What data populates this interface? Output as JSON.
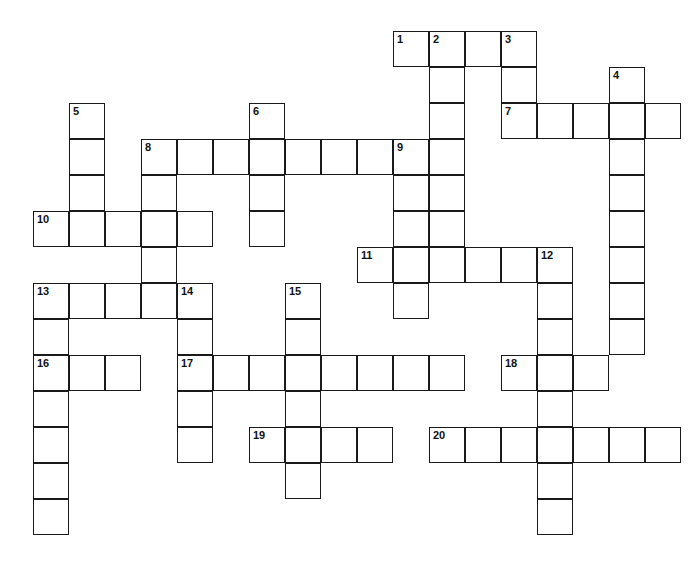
{
  "puzzle": {
    "title": "Crossword Puzzle Grid",
    "background_color": "#ffffff",
    "cell_fill_color": "#ffffff",
    "cell_border_color": "#1a1a1a",
    "number_color": "#111111",
    "cell_size_px": 36,
    "grid_origin_x": 33,
    "grid_origin_y": 31,
    "columns": 18,
    "rows": 14,
    "total_cells": 114,
    "numbered_clue_count": 20
  },
  "numbers": [
    {
      "label": "1",
      "col": 10,
      "row": 0
    },
    {
      "label": "2",
      "col": 11,
      "row": 0
    },
    {
      "label": "3",
      "col": 13,
      "row": 0
    },
    {
      "label": "4",
      "col": 16,
      "row": 1
    },
    {
      "label": "5",
      "col": 1,
      "row": 2
    },
    {
      "label": "6",
      "col": 6,
      "row": 2
    },
    {
      "label": "7",
      "col": 13,
      "row": 2
    },
    {
      "label": "8",
      "col": 3,
      "row": 3
    },
    {
      "label": "9",
      "col": 10,
      "row": 3
    },
    {
      "label": "10",
      "col": 0,
      "row": 5
    },
    {
      "label": "11",
      "col": 9,
      "row": 6
    },
    {
      "label": "12",
      "col": 14,
      "row": 6
    },
    {
      "label": "13",
      "col": 0,
      "row": 7
    },
    {
      "label": "14",
      "col": 4,
      "row": 7
    },
    {
      "label": "15",
      "col": 7,
      "row": 7
    },
    {
      "label": "16",
      "col": 0,
      "row": 9
    },
    {
      "label": "17",
      "col": 4,
      "row": 9
    },
    {
      "label": "18",
      "col": 13,
      "row": 9
    },
    {
      "label": "19",
      "col": 6,
      "row": 11
    },
    {
      "label": "20",
      "col": 11,
      "row": 11
    }
  ],
  "cells": [
    {
      "col": 10,
      "row": 0
    },
    {
      "col": 11,
      "row": 0
    },
    {
      "col": 12,
      "row": 0
    },
    {
      "col": 13,
      "row": 0
    },
    {
      "col": 11,
      "row": 1
    },
    {
      "col": 13,
      "row": 1
    },
    {
      "col": 16,
      "row": 1
    },
    {
      "col": 11,
      "row": 2
    },
    {
      "col": 13,
      "row": 2
    },
    {
      "col": 14,
      "row": 2
    },
    {
      "col": 15,
      "row": 2
    },
    {
      "col": 16,
      "row": 2
    },
    {
      "col": 17,
      "row": 2
    },
    {
      "col": 1,
      "row": 2
    },
    {
      "col": 6,
      "row": 2
    },
    {
      "col": 1,
      "row": 3
    },
    {
      "col": 3,
      "row": 3
    },
    {
      "col": 4,
      "row": 3
    },
    {
      "col": 5,
      "row": 3
    },
    {
      "col": 6,
      "row": 3
    },
    {
      "col": 7,
      "row": 3
    },
    {
      "col": 8,
      "row": 3
    },
    {
      "col": 9,
      "row": 3
    },
    {
      "col": 10,
      "row": 3
    },
    {
      "col": 11,
      "row": 3
    },
    {
      "col": 16,
      "row": 3
    },
    {
      "col": 1,
      "row": 4
    },
    {
      "col": 3,
      "row": 4
    },
    {
      "col": 6,
      "row": 4
    },
    {
      "col": 10,
      "row": 4
    },
    {
      "col": 11,
      "row": 4
    },
    {
      "col": 16,
      "row": 4
    },
    {
      "col": 0,
      "row": 5
    },
    {
      "col": 1,
      "row": 5
    },
    {
      "col": 2,
      "row": 5
    },
    {
      "col": 3,
      "row": 5
    },
    {
      "col": 4,
      "row": 5
    },
    {
      "col": 6,
      "row": 5
    },
    {
      "col": 10,
      "row": 5
    },
    {
      "col": 11,
      "row": 5
    },
    {
      "col": 16,
      "row": 5
    },
    {
      "col": 3,
      "row": 6
    },
    {
      "col": 9,
      "row": 6
    },
    {
      "col": 10,
      "row": 6
    },
    {
      "col": 11,
      "row": 6
    },
    {
      "col": 12,
      "row": 6
    },
    {
      "col": 13,
      "row": 6
    },
    {
      "col": 14,
      "row": 6
    },
    {
      "col": 16,
      "row": 6
    },
    {
      "col": 0,
      "row": 7
    },
    {
      "col": 1,
      "row": 7
    },
    {
      "col": 2,
      "row": 7
    },
    {
      "col": 3,
      "row": 7
    },
    {
      "col": 4,
      "row": 7
    },
    {
      "col": 7,
      "row": 7
    },
    {
      "col": 10,
      "row": 7
    },
    {
      "col": 14,
      "row": 7
    },
    {
      "col": 16,
      "row": 7
    },
    {
      "col": 0,
      "row": 8
    },
    {
      "col": 4,
      "row": 8
    },
    {
      "col": 7,
      "row": 8
    },
    {
      "col": 14,
      "row": 8
    },
    {
      "col": 16,
      "row": 8
    },
    {
      "col": 0,
      "row": 9
    },
    {
      "col": 1,
      "row": 9
    },
    {
      "col": 2,
      "row": 9
    },
    {
      "col": 4,
      "row": 9
    },
    {
      "col": 5,
      "row": 9
    },
    {
      "col": 6,
      "row": 9
    },
    {
      "col": 7,
      "row": 9
    },
    {
      "col": 8,
      "row": 9
    },
    {
      "col": 9,
      "row": 9
    },
    {
      "col": 10,
      "row": 9
    },
    {
      "col": 11,
      "row": 9
    },
    {
      "col": 13,
      "row": 9
    },
    {
      "col": 14,
      "row": 9
    },
    {
      "col": 15,
      "row": 9
    },
    {
      "col": 0,
      "row": 10
    },
    {
      "col": 4,
      "row": 10
    },
    {
      "col": 7,
      "row": 10
    },
    {
      "col": 14,
      "row": 10
    },
    {
      "col": 0,
      "row": 11
    },
    {
      "col": 4,
      "row": 11
    },
    {
      "col": 6,
      "row": 11
    },
    {
      "col": 7,
      "row": 11
    },
    {
      "col": 8,
      "row": 11
    },
    {
      "col": 9,
      "row": 11
    },
    {
      "col": 11,
      "row": 11
    },
    {
      "col": 12,
      "row": 11
    },
    {
      "col": 13,
      "row": 11
    },
    {
      "col": 14,
      "row": 11
    },
    {
      "col": 15,
      "row": 11
    },
    {
      "col": 16,
      "row": 11
    },
    {
      "col": 17,
      "row": 11
    },
    {
      "col": 0,
      "row": 12
    },
    {
      "col": 7,
      "row": 12
    },
    {
      "col": 14,
      "row": 12
    },
    {
      "col": 0,
      "row": 13
    },
    {
      "col": 14,
      "row": 13
    }
  ]
}
